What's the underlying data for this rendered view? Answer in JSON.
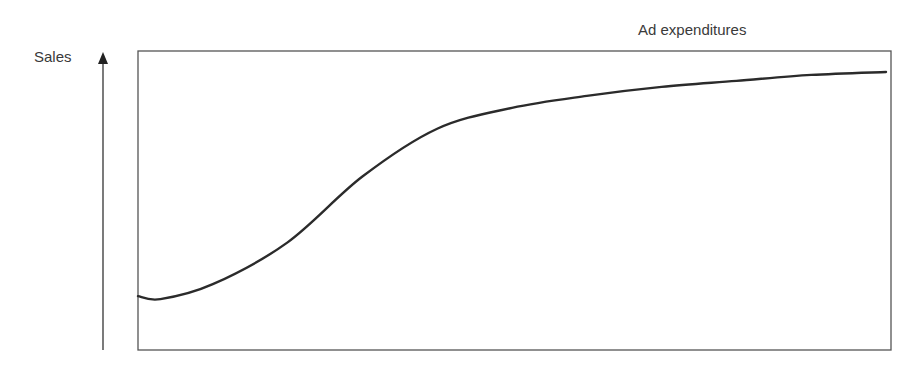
{
  "chart_data": {
    "type": "line",
    "title": "",
    "xlabel": "Ad expenditures",
    "ylabel": "Sales",
    "grid": false,
    "legend": null,
    "axes_ticks": "none (conceptual diagram, no numeric scale)",
    "series": [
      {
        "name": "Sales response",
        "x": [
          0,
          0.03,
          0.1,
          0.2,
          0.3,
          0.4,
          0.5,
          0.6,
          0.7,
          0.8,
          0.9,
          1.0
        ],
        "y": [
          0.18,
          0.17,
          0.22,
          0.36,
          0.58,
          0.74,
          0.81,
          0.85,
          0.88,
          0.9,
          0.92,
          0.93
        ]
      }
    ],
    "xlim": [
      0,
      1
    ],
    "ylim": [
      0,
      1
    ],
    "curve_color": "#2b2b2b",
    "frame_color": "#555555"
  }
}
